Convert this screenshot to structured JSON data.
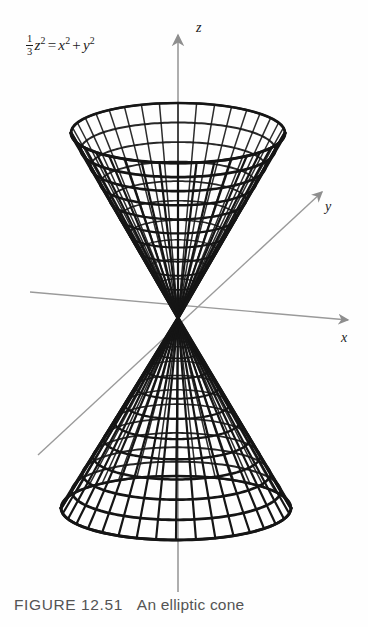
{
  "figure": {
    "caption_label": "FIGURE 12.51",
    "caption_text": "An elliptic cone",
    "equation": {
      "frac_numerator": "1",
      "frac_denominator": "3",
      "lhs_var": "z",
      "lhs_exp": "2",
      "equals": "=",
      "rhs_first_var": "x",
      "rhs_first_exp": "2",
      "plus": "+",
      "rhs_second_var": "y",
      "rhs_second_exp": "2"
    }
  },
  "axes": {
    "z_label": "z",
    "y_label": "y",
    "x_label": "x",
    "axis_color": "#9a9a9a",
    "origin": {
      "x": 178,
      "y": 318
    }
  },
  "surface": {
    "name": "elliptic-cone",
    "mesh_color": "#151515",
    "upper_nappe": {
      "rim_center_x": 178,
      "rim_center_y": 133,
      "rim_radius_x": 107,
      "rim_radius_y": 30,
      "apex_x": 178,
      "apex_y": 318
    },
    "lower_nappe": {
      "rim_center_x": 176,
      "rim_center_y": 508,
      "rim_radius_x": 115,
      "rim_radius_y": 32,
      "apex_x": 178,
      "apex_y": 318
    },
    "radial_lines": 36,
    "ring_lines": 11
  },
  "chart_data": {
    "type": "line",
    "title": "An elliptic cone",
    "equation_text": "(1/3)z^2 = x^2 + y^2",
    "xlabel": "x",
    "ylabel": "y",
    "zlabel": "z",
    "grid": false,
    "legend": "none",
    "surface_type": "elliptic cone (double nappe)",
    "projection": "oblique-3d",
    "mesh_u_count": 36,
    "mesh_v_count": 11
  }
}
